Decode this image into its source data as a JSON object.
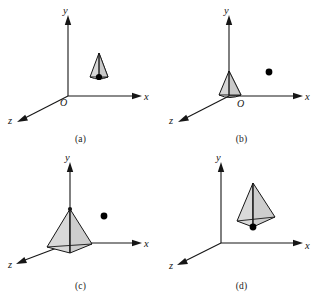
{
  "figure": {
    "type": "diagram",
    "background_color": "#ffffff",
    "line_color": "#161616",
    "shape_fill_color": "#d6d6d6",
    "dot_color": "#000000",
    "panel_grid": {
      "rows": 2,
      "cols": 2
    }
  },
  "panels": [
    {
      "id": "a",
      "caption": "(a)",
      "axes": {
        "x": {
          "label": "x",
          "direction": "right"
        },
        "y": {
          "label": "y",
          "direction": "up"
        },
        "z": {
          "label": "z",
          "direction": "down-left"
        },
        "origin_label": "O",
        "show_origin_label": true
      },
      "solid": {
        "name": "tetrahedron",
        "size": "small",
        "position": "above the x-axis, right of the y-axis",
        "filled": true
      },
      "dot": {
        "visible": true,
        "position": "at the lower vertex of the tetrahedron"
      }
    },
    {
      "id": "b",
      "caption": "(b)",
      "axes": {
        "x": {
          "label": "x",
          "direction": "right"
        },
        "y": {
          "label": "y",
          "direction": "up"
        },
        "z": {
          "label": "z",
          "direction": "down-left"
        },
        "origin_label": "O",
        "show_origin_label": true
      },
      "solid": {
        "name": "tetrahedron",
        "size": "small",
        "position": "resting at the origin",
        "filled": true
      },
      "dot": {
        "visible": true,
        "position": "upper right of the origin, detached from the solid"
      }
    },
    {
      "id": "c",
      "caption": "(c)",
      "axes": {
        "x": {
          "label": "x",
          "direction": "right"
        },
        "y": {
          "label": "y",
          "direction": "up"
        },
        "z": {
          "label": "z",
          "direction": "down-left"
        },
        "origin_label": "",
        "show_origin_label": false
      },
      "solid": {
        "name": "tetrahedron",
        "size": "medium",
        "position": "apex on the y-axis with base spread across the xz-plane",
        "filled": true
      },
      "dot": {
        "visible": true,
        "position": "right of the solid, above the x-axis"
      }
    },
    {
      "id": "d",
      "caption": "(d)",
      "axes": {
        "x": {
          "label": "x",
          "direction": "right"
        },
        "y": {
          "label": "y",
          "direction": "up"
        },
        "z": {
          "label": "z",
          "direction": "down-left"
        },
        "origin_label": "",
        "show_origin_label": false
      },
      "solid": {
        "name": "tetrahedron",
        "size": "large",
        "position": "floating in the first quadrant above the x-axis",
        "filled": true
      },
      "dot": {
        "visible": true,
        "position": "at the lower vertex of the tetrahedron"
      }
    }
  ]
}
